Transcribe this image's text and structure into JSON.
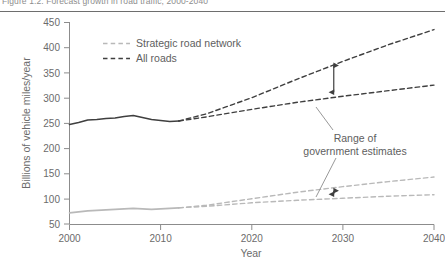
{
  "figure": {
    "caption": "Figure 1.2: Forecast growth in road traffic, 2000-2040",
    "caption_visible": "partially-cropped"
  },
  "colors": {
    "all_roads": "#3f3f3f",
    "strategic_road_network": "#b9b9b9",
    "axis": "#8c8c8c",
    "text": "#6b6b6b",
    "rule": "#6e6e6e",
    "annotation": "#5e5e5e"
  },
  "axes": {
    "y": {
      "label": "Billions of vehicle miles/year",
      "ticks": [
        "50",
        "100",
        "150",
        "200",
        "250",
        "300",
        "350",
        "400",
        "450"
      ],
      "min": 50,
      "max": 450,
      "step": 50
    },
    "x": {
      "label": "Year",
      "ticks": [
        "2000",
        "2010",
        "2020",
        "2030",
        "2040"
      ],
      "min": 2000,
      "max": 2040,
      "step": 10
    }
  },
  "legend": {
    "position": "top-left-inside",
    "items": [
      {
        "label": "Strategic road network",
        "style": "dashed",
        "color": "#b9b9b9"
      },
      {
        "label": "All roads",
        "style": "dashed",
        "color": "#3f3f3f"
      }
    ]
  },
  "annotations": [
    {
      "name": "range-of-government-estimates",
      "line1": "Range of",
      "line2": "government estimates"
    }
  ],
  "chart_data": {
    "type": "line",
    "title": "Forecast growth in road traffic",
    "xlabel": "Year",
    "ylabel": "Billions of vehicle miles/year",
    "xlim": [
      2000,
      2040
    ],
    "ylim": [
      50,
      450
    ],
    "grid": false,
    "legend_position": "upper left",
    "series": [
      {
        "name": "All roads - historic",
        "style": "solid",
        "color": "#3f3f3f",
        "x": [
          2000,
          2001,
          2002,
          2003,
          2004,
          2005,
          2006,
          2007,
          2008,
          2009,
          2010,
          2011,
          2012
        ],
        "y": [
          247,
          251,
          256,
          257,
          259,
          260,
          263,
          265,
          261,
          257,
          255,
          253,
          254
        ]
      },
      {
        "name": "All roads - forecast high",
        "style": "dashed",
        "color": "#3f3f3f",
        "x": [
          2012,
          2015,
          2020,
          2025,
          2030,
          2035,
          2040
        ],
        "y": [
          254,
          268,
          300,
          337,
          372,
          405,
          435
        ]
      },
      {
        "name": "All roads - forecast low",
        "style": "dashed",
        "color": "#3f3f3f",
        "x": [
          2012,
          2015,
          2020,
          2025,
          2030,
          2035,
          2040
        ],
        "y": [
          254,
          262,
          277,
          291,
          303,
          314,
          325
        ]
      },
      {
        "name": "Strategic road network - historic",
        "style": "solid",
        "color": "#b9b9b9",
        "x": [
          2000,
          2001,
          2002,
          2003,
          2004,
          2005,
          2006,
          2007,
          2008,
          2009,
          2010,
          2011,
          2012
        ],
        "y": [
          72,
          74,
          76,
          77,
          78,
          79,
          80,
          81,
          80,
          79,
          80,
          81,
          82
        ]
      },
      {
        "name": "Strategic road network - forecast high",
        "style": "dashed",
        "color": "#b9b9b9",
        "x": [
          2012,
          2015,
          2020,
          2025,
          2030,
          2035,
          2040
        ],
        "y": [
          82,
          87,
          100,
          113,
          124,
          134,
          143
        ]
      },
      {
        "name": "Strategic road network - forecast low",
        "style": "dashed",
        "color": "#b9b9b9",
        "x": [
          2012,
          2015,
          2020,
          2025,
          2030,
          2035,
          2040
        ],
        "y": [
          82,
          85,
          92,
          97,
          101,
          105,
          108
        ]
      }
    ],
    "range_markers": [
      {
        "name": "all-roads-range",
        "x": 2029,
        "y_low": 303,
        "y_high": 372
      },
      {
        "name": "strategic-road-network-range",
        "x": 2029,
        "y_low": 101,
        "y_high": 124
      }
    ]
  }
}
